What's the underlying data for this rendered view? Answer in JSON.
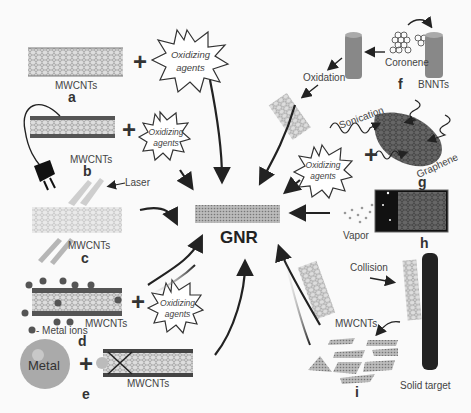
{
  "diagram": {
    "center_label": "GNR",
    "panels": [
      {
        "id": "a",
        "letter": "a",
        "material": "MWCNTs",
        "reagent": "Oxidizing agents"
      },
      {
        "id": "b",
        "letter": "b",
        "material": "MWCNTs",
        "reagent": "Oxidizing agents"
      },
      {
        "id": "c",
        "letter": "c",
        "material": "MWCNTs",
        "annotation": "Laser"
      },
      {
        "id": "d",
        "letter": "d",
        "material": "MWCNTs",
        "reagent": "Oxidizing agents",
        "legend": "- Metal ions"
      },
      {
        "id": "e",
        "letter": "e",
        "material": "MWCNTs",
        "reagent": "Metal"
      },
      {
        "id": "f",
        "letter": "f",
        "materials": [
          "Coronene",
          "BNNTs"
        ],
        "step": "Oxidation"
      },
      {
        "id": "g",
        "letter": "g",
        "material": "Graphene",
        "process": "Sonication",
        "reagent": "Oxidizing agents"
      },
      {
        "id": "h",
        "letter": "h",
        "material": "Vapor"
      },
      {
        "id": "i",
        "letter": "i",
        "material": "MWCNTs",
        "process": "Collision",
        "target": "Solid target"
      }
    ]
  },
  "labels": {
    "mwcnts": "MWCNTs",
    "ox1": "Oxidizing",
    "ox2": "agents",
    "laser": "Laser",
    "metal_ions": "- Metal ions",
    "metal": "Metal",
    "coronene": "Coronene",
    "bnnts": "BNNTs",
    "oxidation": "Oxidation",
    "sonication": "Sonication",
    "graphene": "Graphene",
    "vapor": "Vapor",
    "collision": "Collision",
    "solid_target": "Solid target",
    "gnr": "GNR",
    "a": "a",
    "b": "b",
    "c": "c",
    "d": "d",
    "e": "e",
    "f": "f",
    "g": "g",
    "h": "h",
    "i": "i"
  }
}
